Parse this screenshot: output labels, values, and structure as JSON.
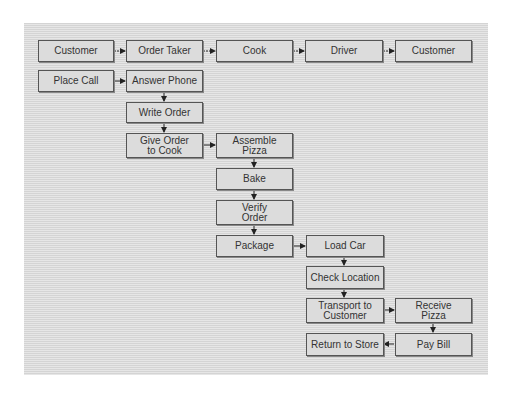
{
  "diagram": {
    "lanes": [
      {
        "label": "Customer"
      },
      {
        "label": "Order Taker"
      },
      {
        "label": "Cook"
      },
      {
        "label": "Driver"
      },
      {
        "label": "Customer"
      }
    ],
    "steps": [
      {
        "label": "Place Call"
      },
      {
        "label": "Answer Phone"
      },
      {
        "label": "Write Order"
      },
      {
        "label": "Give Order\nto Cook"
      },
      {
        "label": "Assemble\nPizza"
      },
      {
        "label": "Bake"
      },
      {
        "label": "Verify\nOrder"
      },
      {
        "label": "Package"
      },
      {
        "label": "Load Car"
      },
      {
        "label": "Check Location"
      },
      {
        "label": "Transport to\nCustomer"
      },
      {
        "label": "Receive\nPizza"
      },
      {
        "label": "Return to Store"
      },
      {
        "label": "Pay Bill"
      }
    ],
    "colors": {
      "box": "#dcdcdc",
      "border": "#555555",
      "background_stripe": "#d4d4d4",
      "text": "#333333"
    }
  }
}
